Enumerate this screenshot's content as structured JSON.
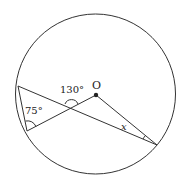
{
  "diagram": {
    "type": "circle-geometry",
    "circle": {
      "cx": 95.5,
      "cy": 94,
      "r": 80
    },
    "center": {
      "label": "O",
      "x": 96,
      "y": 95
    },
    "points": {
      "A": {
        "x": 18,
        "y": 86
      },
      "B": {
        "x": 27,
        "y": 131
      },
      "C": {
        "x": 157,
        "y": 145
      }
    },
    "segments": [
      [
        "A",
        "C"
      ],
      [
        "B",
        "O"
      ],
      [
        "O",
        "C"
      ],
      [
        "A",
        "B"
      ]
    ],
    "angles": [
      {
        "id": "angle-intersection",
        "label": "130°",
        "at": "intersection of AC and BO"
      },
      {
        "id": "angle-b",
        "label": "75°",
        "at": "B"
      },
      {
        "id": "angle-c",
        "label": "x",
        "at": "C"
      }
    ]
  },
  "labels": {
    "center": "O",
    "angle_130": "130°",
    "angle_75": "75°",
    "angle_x": "x"
  },
  "colors": {
    "stroke": "#333333",
    "background": "#ffffff"
  }
}
